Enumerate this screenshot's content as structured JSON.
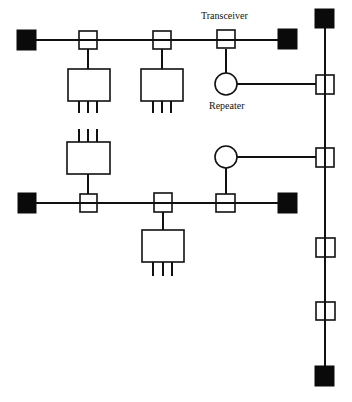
{
  "diagram": {
    "type": "network-topology",
    "labels": {
      "transceiver": "Transceiver",
      "repeater": "Repeater"
    },
    "colors": {
      "line": "#111111",
      "terminator": "#0a0a0a",
      "background": "#ffffff"
    },
    "segments": [
      {
        "name": "upper-segment",
        "orientation": "horizontal",
        "transceivers": 3,
        "terminators": 2,
        "stations": 2,
        "repeaters": 1
      },
      {
        "name": "lower-segment",
        "orientation": "horizontal",
        "transceivers": 3,
        "terminators": 2,
        "stations": 2,
        "repeaters": 1
      },
      {
        "name": "backbone",
        "orientation": "vertical",
        "transceivers": 4,
        "terminators": 2
      }
    ]
  }
}
